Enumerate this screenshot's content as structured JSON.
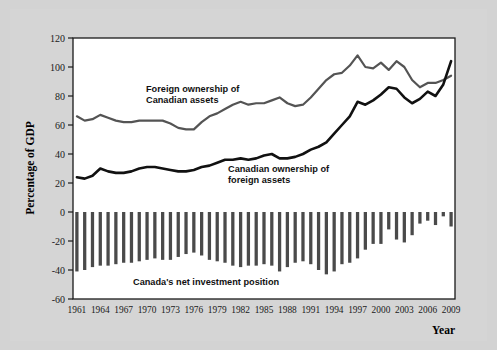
{
  "figure": {
    "background_color": "#d3d3d3",
    "plot_background_color": "#ffffff",
    "axis_title_y": "Percentage of GDP",
    "axis_title_x": "Year"
  },
  "annotations": {
    "foreign_line_1": "Foreign ownership of",
    "foreign_line_2": "Canadian assets",
    "canadian_line_1": "Canadian ownership of",
    "canadian_line_2": "foreign assets",
    "bars_label": "Canada's net investment position"
  },
  "colors": {
    "foreign_ownership_line": "#545454",
    "canadian_ownership_line": "#111111",
    "net_position_bars": "#4a4a4a",
    "axis": "#1a1a1a"
  },
  "chart_data": {
    "type": "line",
    "title": "",
    "xlabel": "Year",
    "ylabel": "Percentage of GDP",
    "ylim": [
      -60,
      120
    ],
    "yticks": [
      -60,
      -40,
      -20,
      0,
      20,
      40,
      60,
      80,
      100,
      120
    ],
    "ytick_labels": [
      "-60",
      "-40",
      "-20",
      "0",
      "20",
      "40",
      "60",
      "80",
      "100",
      "120"
    ],
    "xlim": [
      1961,
      2009
    ],
    "xticks": [
      1961,
      1964,
      1967,
      1970,
      1973,
      1976,
      1979,
      1982,
      1985,
      1988,
      1991,
      1994,
      1997,
      2000,
      2003,
      2006,
      2009
    ],
    "xtick_labels": [
      "1961",
      "1964",
      "1967",
      "1970",
      "1973",
      "1976",
      "1979",
      "1982",
      "1985",
      "1988",
      "1991",
      "1994",
      "1997",
      "2000",
      "2003",
      "2006",
      "2009"
    ],
    "grid": false,
    "legend_position": "inline-annotations",
    "x": [
      1961,
      1962,
      1963,
      1964,
      1965,
      1966,
      1967,
      1968,
      1969,
      1970,
      1971,
      1972,
      1973,
      1974,
      1975,
      1976,
      1977,
      1978,
      1979,
      1980,
      1981,
      1982,
      1983,
      1984,
      1985,
      1986,
      1987,
      1988,
      1989,
      1990,
      1991,
      1992,
      1993,
      1994,
      1995,
      1996,
      1997,
      1998,
      1999,
      2000,
      2001,
      2002,
      2003,
      2004,
      2005,
      2006,
      2007,
      2008,
      2009
    ],
    "series": [
      {
        "name": "Foreign ownership of Canadian assets",
        "type": "line",
        "color": "#545454",
        "values": [
          66,
          63,
          64,
          67,
          65,
          63,
          62,
          62,
          63,
          63,
          63,
          63,
          61,
          58,
          57,
          57,
          62,
          66,
          68,
          71,
          74,
          76,
          74,
          75,
          75,
          77,
          79,
          75,
          73,
          74,
          79,
          85,
          91,
          95,
          96,
          101,
          108,
          100,
          99,
          103,
          98,
          104,
          100,
          91,
          86,
          89,
          89,
          91,
          94
        ]
      },
      {
        "name": "Canadian ownership of foreign assets",
        "type": "line",
        "color": "#111111",
        "values": [
          24,
          23,
          25,
          30,
          28,
          27,
          27,
          28,
          30,
          31,
          31,
          30,
          29,
          28,
          28,
          29,
          31,
          32,
          34,
          36,
          36,
          37,
          36,
          37,
          39,
          40,
          37,
          37,
          38,
          40,
          43,
          45,
          48,
          54,
          60,
          66,
          76,
          74,
          77,
          81,
          86,
          85,
          79,
          75,
          78,
          83,
          80,
          88,
          104
        ]
      }
    ],
    "bar_series": {
      "name": "Canada's net investment position",
      "type": "bar",
      "color": "#4a4a4a",
      "values": [
        -41,
        -40,
        -38,
        -37,
        -37,
        -36,
        -35,
        -35,
        -34,
        -33,
        -32,
        -33,
        -33,
        -31,
        -29,
        -28,
        -30,
        -33,
        -34,
        -35,
        -37,
        -38,
        -37,
        -37,
        -36,
        -37,
        -41,
        -38,
        -35,
        -34,
        -36,
        -40,
        -43,
        -41,
        -36,
        -35,
        -32,
        -26,
        -22,
        -22,
        -12,
        -19,
        -21,
        -16,
        -8,
        -6,
        -9,
        -3,
        -10
      ]
    }
  }
}
